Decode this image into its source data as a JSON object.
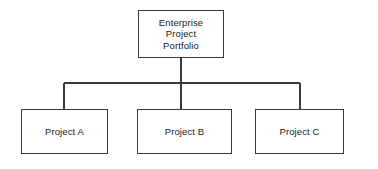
{
  "diagram": {
    "type": "organization-hierarchy-tree",
    "title": "Enterprise Project Portfolio",
    "orientation": "top-down",
    "background_color": "#ffffff",
    "line_color": "#3a3a3a",
    "border_color": "#3a3a3a",
    "text_color": "#1a1a1a",
    "root": {
      "id": "root",
      "label": "Enterprise\nProject\nPortfolio",
      "line_1": "Enterprise",
      "line_2": "Project",
      "line_3": "Portfolio"
    },
    "children": [
      {
        "id": "project-a",
        "label": "Project A"
      },
      {
        "id": "project-b",
        "label": "Project B"
      },
      {
        "id": "project-c",
        "label": "Project C"
      }
    ],
    "connectors": {
      "root_stem_label": "root-to-bus-connector",
      "bus_label": "horizontal-bus-connector",
      "branch_left_label": "branch-to-project-a",
      "branch_center_label": "branch-to-project-b",
      "branch_right_label": "branch-to-project-c"
    }
  }
}
